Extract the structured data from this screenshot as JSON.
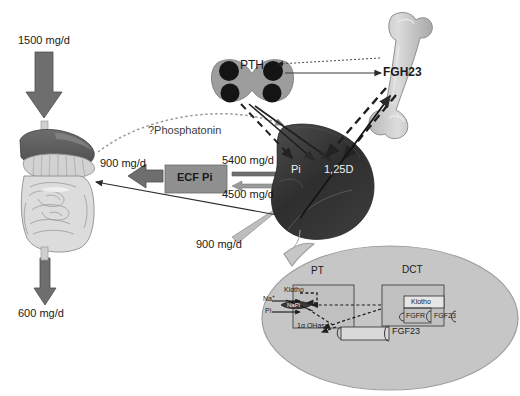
{
  "diagram": {
    "type": "physiology-flow-diagram"
  },
  "fluxes": {
    "dietary_intake": "1500 mg/d",
    "fecal_loss": "600 mg/d",
    "intestinal_absorption": "900 mg/d",
    "filtered_load": "5400 mg/d",
    "reabsorbed": "4500 mg/d",
    "urinary_excretion": "900 mg/d"
  },
  "pools": {
    "ecf": "ECF Pi",
    "kidney_pi": "Pi",
    "kidney_vitd": "1,25D"
  },
  "organs": {
    "gut": "intestine-liver",
    "kidney": "kidney",
    "bone": "bone",
    "parathyroid": "parathyroid-gland"
  },
  "hormones": {
    "pth": "PTH",
    "fgf23_bone": "FGH23",
    "phosphatonin": "?Phosphatonin"
  },
  "inset": {
    "pt_label": "PT",
    "dct_label": "DCT",
    "klotho_pt": "Klotho",
    "klotho_dct": "Klotho",
    "fgfr": "FGFR",
    "fgf23_dct": "FGF23",
    "fgf23_pt": "FGF23",
    "napi": "NaPi",
    "sodium": "Na",
    "sodium_charge": "+",
    "phosphate": "Pi",
    "ohase": "1α OHase"
  },
  "colors": {
    "arrow_gray": "#6e6e6e",
    "ecf_box": "#8f8f8f",
    "kidney_dark": "#333333",
    "bone_light": "#c9c9c9",
    "gland_gray": "#9a9a9a",
    "gland_dot": "#151515",
    "inset_fill": "#c6c6c6",
    "liver_dark": "#5a5a5a",
    "gut_light": "#d8d8d8"
  }
}
